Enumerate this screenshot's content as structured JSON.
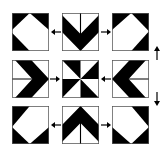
{
  "diagram": {
    "colors": {
      "fill": "#000000",
      "background": "#ffffff",
      "border": "#555555"
    },
    "tiles": [
      {
        "id": "r1c1",
        "row": 1,
        "col": 1,
        "pattern": "pentagon-diamond-top-right-open"
      },
      {
        "id": "r1c2",
        "row": 1,
        "col": 2,
        "pattern": "chevron-down-with-vertical-line"
      },
      {
        "id": "r1c3",
        "row": 1,
        "col": 3,
        "pattern": "pentagon-diamond-top-left-open"
      },
      {
        "id": "r2c1",
        "row": 2,
        "col": 1,
        "pattern": "chevron-right-with-horizontal-line"
      },
      {
        "id": "r2c2",
        "row": 2,
        "col": 2,
        "pattern": "pinwheel"
      },
      {
        "id": "r2c3",
        "row": 2,
        "col": 3,
        "pattern": "chevron-left-with-horizontal-line"
      },
      {
        "id": "r3c1",
        "row": 3,
        "col": 1,
        "pattern": "pentagon-diamond-bottom-right-open"
      },
      {
        "id": "r3c2",
        "row": 3,
        "col": 2,
        "pattern": "chevron-up-with-vertical-line"
      },
      {
        "id": "r3c3",
        "row": 3,
        "col": 3,
        "pattern": "pentagon-diamond-bottom-left-open"
      }
    ],
    "arrows": [
      {
        "id": "a1",
        "from": "r1c2",
        "to": "r1c1",
        "direction": "left"
      },
      {
        "id": "a2",
        "from": "r1c2",
        "to": "r1c3",
        "direction": "right"
      },
      {
        "id": "a3",
        "from": "r2c1",
        "to": "r2c2",
        "direction": "right"
      },
      {
        "id": "a4",
        "from": "r2c3",
        "to": "r2c2",
        "direction": "left"
      },
      {
        "id": "a5",
        "from": "r3c2",
        "to": "r3c1",
        "direction": "left"
      },
      {
        "id": "a6",
        "from": "r3c2",
        "to": "r3c3",
        "direction": "right"
      },
      {
        "id": "a7",
        "side": "right",
        "direction": "up"
      },
      {
        "id": "a8",
        "side": "right",
        "direction": "down"
      }
    ]
  }
}
